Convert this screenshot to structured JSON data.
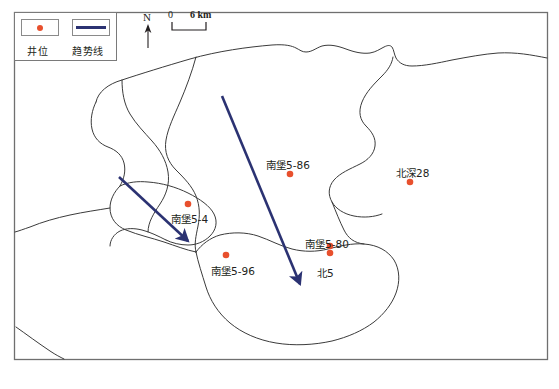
{
  "figure": {
    "caption": "",
    "frame_color": "#6f6f6f",
    "background": "#ffffff"
  },
  "legend": {
    "name": "map-legend",
    "items": [
      {
        "label": "井位",
        "symbol": "dot",
        "color": "#e8502d"
      },
      {
        "label": "趋势线",
        "symbol": "line",
        "color": "#2b3272"
      }
    ]
  },
  "north_arrow": {
    "label": "N"
  },
  "scale_bar": {
    "min_label": "0",
    "max_label": "6 km",
    "unit": "km",
    "length_value": 6
  },
  "wells": [
    {
      "name": "南堡5-86",
      "label_x": 266,
      "label_y": 157,
      "dot_x": 290,
      "dot_y": 174
    },
    {
      "name": "北深28",
      "label_x": 396,
      "label_y": 165,
      "dot_x": 410,
      "dot_y": 182
    },
    {
      "name": "南堡5-4",
      "label_x": 171,
      "label_y": 211,
      "dot_x": 188,
      "dot_y": 204
    },
    {
      "name": "南堡5-96",
      "label_x": 211,
      "label_y": 263,
      "dot_x": 226,
      "dot_y": 255
    },
    {
      "name": "南堡5-80",
      "label_x": 305,
      "label_y": 236,
      "dot_x": 330,
      "dot_y": 246
    },
    {
      "name": "北5",
      "label_x": 317,
      "label_y": 265,
      "dot_x": 330,
      "dot_y": 253
    }
  ],
  "trend_lines": [
    {
      "name": "trend-arrow-main",
      "x1": 222,
      "y1": 96,
      "x2": 302,
      "y2": 288,
      "color": "#2b3272"
    },
    {
      "name": "trend-arrow-west",
      "x1": 119,
      "y1": 177,
      "x2": 191,
      "y2": 244,
      "color": "#2b3272"
    }
  ],
  "contours": {
    "stroke": "#3b3b3b",
    "count": 9
  }
}
